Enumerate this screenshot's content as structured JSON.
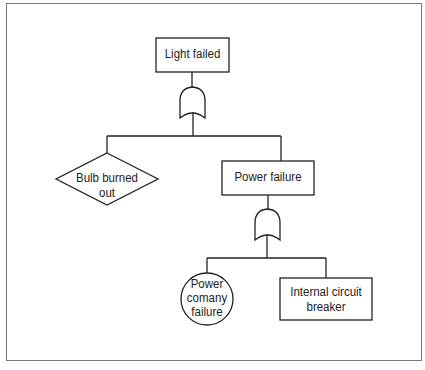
{
  "diagram": {
    "type": "fault-tree",
    "nodes": {
      "top_event": {
        "label": "Light failed",
        "shape": "rectangle"
      },
      "or_gate_1": {
        "label": "OR",
        "shape": "or-gate"
      },
      "bulb": {
        "label_line1": "Bulb burned",
        "label_line2": "out",
        "shape": "diamond"
      },
      "power_failure": {
        "label": "Power failure",
        "shape": "rectangle"
      },
      "or_gate_2": {
        "label": "OR",
        "shape": "or-gate"
      },
      "power_company": {
        "label_line1": "Power",
        "label_line2": "comany",
        "label_line3": "failure",
        "shape": "circle"
      },
      "breaker": {
        "label_line1": "Internal circuit",
        "label_line2": "breaker",
        "shape": "rectangle"
      }
    },
    "colors": {
      "stroke": "#222222",
      "frame": "#777777",
      "background": "#ffffff"
    }
  }
}
